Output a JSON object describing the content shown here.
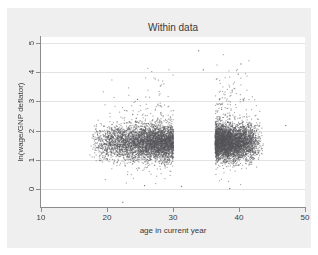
{
  "chart_data": {
    "type": "scatter",
    "title": "Within data",
    "xlabel": "age in current year",
    "ylabel": "ln(wage/GNP deflator)",
    "xlim": [
      10,
      50
    ],
    "ylim": [
      -0.6,
      5.2
    ],
    "xticks": [
      10,
      20,
      30,
      40,
      50
    ],
    "xtick_labels": [
      "10",
      "20",
      "30",
      "40",
      "50"
    ],
    "yticks": [
      0,
      1,
      2,
      3,
      4,
      5
    ],
    "ytick_labels": [
      "0",
      "1",
      "2",
      "3",
      "4",
      "5"
    ],
    "grid": "horizontal",
    "legend": "none",
    "marker": {
      "shape": "circle",
      "color": "#55555a",
      "size_px": 1.1,
      "opacity": 0.55
    },
    "n_points_rendered": 9000,
    "distribution": {
      "x_core_min": 16.5,
      "x_core_max": 44.0,
      "x_mode": 30.0,
      "y_core_mean": 1.62,
      "y_core_sd": 0.3,
      "y_outlier_max": 4.75,
      "y_outlier_min": -0.45,
      "dense_band": {
        "x_from": 20.0,
        "x_to": 42.0,
        "y_from": 1.25,
        "y_to": 2.0
      }
    },
    "colors": {
      "figure_background": "#efefef",
      "plot_background": "#ffffff",
      "gridline": "#e3e3e3",
      "axis": "#8c8c8c",
      "text": "#3a3a3a",
      "marker": "#55555a"
    }
  }
}
